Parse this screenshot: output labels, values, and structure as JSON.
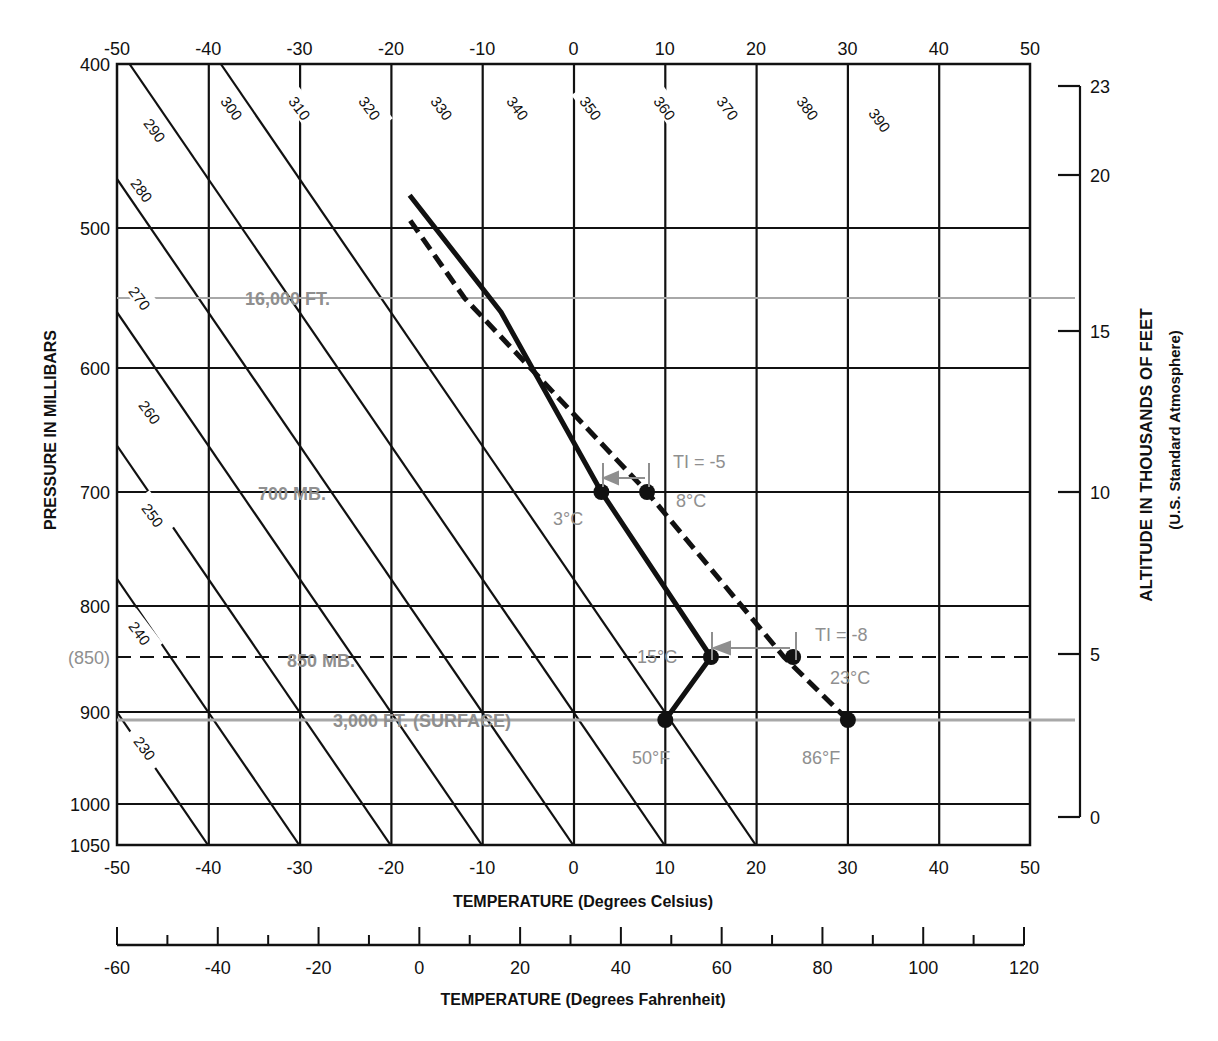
{
  "chart_data": {
    "type": "line",
    "title": "",
    "xlabel": "TEMPERATURE (Degrees Celsius)",
    "xlabel_secondary": "TEMPERATURE (Degrees Fahrenheit)",
    "ylabel": "PRESSURE IN MILLIBARS",
    "ylabel_right": "ALTITUDE IN THOUSANDS OF FEET",
    "ylabel_right_sub": "(U.S. Standard Atmosphere)",
    "xlim": [
      -50,
      50
    ],
    "ylim": [
      1050,
      400
    ],
    "grid": true,
    "celsius_ticks": [
      "-50",
      "-40",
      "-30",
      "-20",
      "-10",
      "0",
      "10",
      "20",
      "30",
      "40",
      "50"
    ],
    "fahrenheit_ticks": [
      "-60",
      "-40",
      "-20",
      "0",
      "20",
      "40",
      "60",
      "80",
      "100",
      "120"
    ],
    "pressure_ticks": [
      "400",
      "500",
      "600",
      "700",
      "800",
      "900",
      "1000",
      "1050"
    ],
    "pressure_extra_tick": "(850)",
    "altitude_ticks": [
      "23",
      "20",
      "15",
      "10",
      "5",
      "0"
    ],
    "dry_adiabat_labels": [
      "290",
      "300",
      "310",
      "320",
      "330",
      "340",
      "350",
      "360",
      "370",
      "380",
      "390",
      "280",
      "270",
      "260",
      "250",
      "240",
      "230"
    ],
    "series": [
      {
        "name": "Environmental sounding (solid)",
        "points": [
          {
            "t": 10,
            "p": 910
          },
          {
            "t": 15,
            "p": 850
          },
          {
            "t": 3,
            "p": 700
          },
          {
            "t": -8,
            "p": 560
          },
          {
            "t": -18,
            "p": 480
          }
        ]
      },
      {
        "name": "Dry adiabat from 86°F surface (dashed)",
        "points": [
          {
            "t": 30,
            "p": 910
          },
          {
            "t": 23,
            "p": 850
          },
          {
            "t": 8,
            "p": 700
          },
          {
            "t": -12,
            "p": 550
          },
          {
            "t": -18,
            "p": 495
          }
        ]
      }
    ],
    "reference_lines": [
      {
        "label": "16,000 FT.",
        "p": 550
      },
      {
        "label": "700 MB.",
        "p": 700
      },
      {
        "label": "850 MB.",
        "p": 850
      },
      {
        "label": "3,000 FT. (SURFACE)",
        "p": 910
      }
    ],
    "annotations": [
      {
        "text": "TI = -5",
        "t": 10,
        "p": 680
      },
      {
        "text": "3°C",
        "t": 3,
        "p": 700
      },
      {
        "text": "8°C",
        "t": 8,
        "p": 700
      },
      {
        "text": "TI = -8",
        "t": 24,
        "p": 840
      },
      {
        "text": "15°C",
        "t": 15,
        "p": 850
      },
      {
        "text": "23°C",
        "t": 23,
        "p": 850
      },
      {
        "text": "50°F",
        "t": 10,
        "p": 910
      },
      {
        "text": "86°F",
        "t": 30,
        "p": 910
      }
    ]
  },
  "labels": {
    "x_title": "TEMPERATURE (Degrees Celsius)",
    "f_title": "TEMPERATURE (Degrees Fahrenheit)",
    "y_title": "PRESSURE IN MILLIBARS",
    "alt_title": "ALTITUDE IN THOUSANDS OF FEET",
    "alt_sub": "(U.S. Standard Atmosphere)",
    "p850": "(850)",
    "line_16000": "16,000 FT.",
    "line_700": "700 MB.",
    "line_850": "850 MB.",
    "line_surface": "3,000 FT. (SURFACE)",
    "ti5": "TI = -5",
    "c3": "3°C",
    "c8": "8°C",
    "ti8": "TI = -8",
    "c15": "15°C",
    "c23": "23°C",
    "f50": "50°F",
    "f86": "86°F"
  }
}
